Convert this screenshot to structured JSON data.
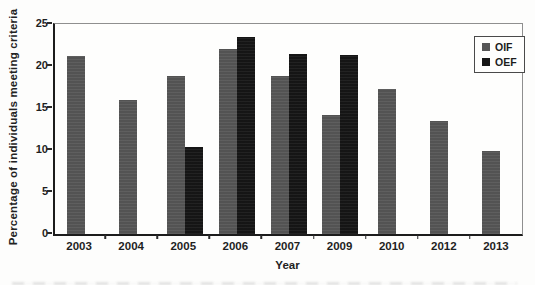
{
  "figure": {
    "background": "#fdfdfc",
    "axis_color": "#1c1c1c",
    "box_color": "#8f8f8f",
    "text_color": "#1a1a1a"
  },
  "chart_data": {
    "type": "bar",
    "title": "",
    "xlabel": "Year",
    "ylabel": "Percentage of individuals meeting criteria",
    "categories": [
      "2003",
      "2004",
      "2005",
      "2006",
      "2007",
      "2009",
      "2010",
      "2012",
      "2013"
    ],
    "series": [
      {
        "name": "OIF",
        "color": "#565656",
        "values": [
          21.2,
          16.0,
          18.8,
          22.0,
          18.8,
          14.2,
          17.3,
          13.4,
          9.9
        ]
      },
      {
        "name": "OEF",
        "color": "#161616",
        "values": [
          null,
          null,
          10.4,
          23.4,
          21.4,
          21.3,
          null,
          null,
          null
        ]
      }
    ],
    "ylim": [
      0,
      25
    ],
    "yticks": [
      0,
      5,
      10,
      15,
      20,
      25
    ],
    "grid": false,
    "legend_position": "upper-right",
    "bar_width_px": 18
  },
  "legend": {
    "items": [
      {
        "label": "OIF",
        "color": "#565656"
      },
      {
        "label": "OEF",
        "color": "#161616"
      }
    ]
  }
}
